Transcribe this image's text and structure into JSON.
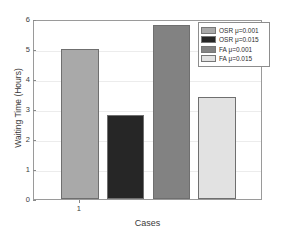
{
  "chart_data": {
    "type": "bar",
    "title": "",
    "xlabel": "Cases",
    "ylabel": "Waiting Time (Hours)",
    "categories": [
      "1"
    ],
    "x_tick_labels": [
      "1"
    ],
    "y_tick_labels": [
      "0",
      "1",
      "2",
      "3",
      "4",
      "5",
      "6"
    ],
    "ylim": [
      0,
      6
    ],
    "xlim": [
      0,
      1
    ],
    "grid": true,
    "legend_position": "top-right",
    "series": [
      {
        "name": "OSR μ=0.001",
        "values": [
          5.0
        ],
        "color": "#a9a9a9"
      },
      {
        "name": "OSR μ=0.015",
        "values": [
          2.8
        ],
        "color": "#262626"
      },
      {
        "name": "FA μ=0.001",
        "values": [
          5.8
        ],
        "color": "#828282"
      },
      {
        "name": "FA μ=0.015",
        "values": [
          3.4
        ],
        "color": "#e2e2e2"
      }
    ]
  },
  "legend": {
    "entries": [
      {
        "label": "OSR μ=0.001"
      },
      {
        "label": "OSR μ=0.015"
      },
      {
        "label": "FA μ=0.001"
      },
      {
        "label": "FA μ=0.015"
      }
    ]
  },
  "axes": {
    "y_title": "Waiting Time (Hours)",
    "x_title": "Cases"
  },
  "colors": {
    "axis_line": "#9a9a9a",
    "grid_line": "#ececec",
    "text": "#3a3a3a",
    "bar_border": "#6f6f6f"
  }
}
